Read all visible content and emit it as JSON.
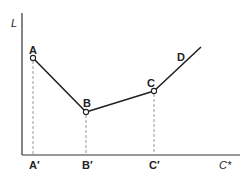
{
  "diagram": {
    "y_axis_label": "L",
    "x_axis_label": "C*",
    "points": [
      {
        "label": "A",
        "x": 33,
        "y": 58,
        "tick_label": "A′"
      },
      {
        "label": "B",
        "x": 86,
        "y": 112,
        "tick_label": "B′"
      },
      {
        "label": "C",
        "x": 154,
        "y": 91,
        "tick_label": "C′"
      }
    ],
    "curve_end_label": "D",
    "colors": {
      "line": "#222222",
      "dashed": "#999999",
      "background": "#ffffff"
    }
  }
}
